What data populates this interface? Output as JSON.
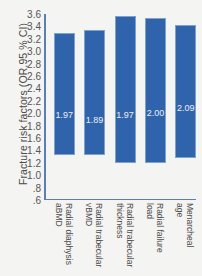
{
  "chart_data": {
    "type": "bar",
    "title": "",
    "subtitle": "",
    "xlabel": "",
    "ylabel": "Fracture risk factors (OR,95 % CI)",
    "ylim": [
      0.6,
      3.6
    ],
    "baseline": 1.0,
    "grid": false,
    "legend": null,
    "ytick_labels": [
      "3.6",
      "3.4",
      "3.2",
      "3.0",
      "2.8",
      "2.6",
      "2.4",
      "2.2",
      "2.0",
      "1.8",
      "1.6",
      "1.4",
      "1.2",
      "1.0",
      ".8",
      ".6"
    ],
    "ytick_values": [
      3.6,
      3.4,
      3.2,
      3.0,
      2.8,
      2.6,
      2.4,
      2.2,
      2.0,
      1.8,
      1.6,
      1.4,
      1.2,
      1.0,
      0.8,
      0.6
    ],
    "categories": [
      "Radial diaphysis\naBMD",
      "Radial trabecular\nvBMD",
      "Radial trabecular\nthickness",
      "Radial failure\nload",
      "Menarcheal\nage"
    ],
    "value_labels": [
      "1.97",
      "1.89",
      "1.97",
      "2.00",
      "2.09"
    ],
    "values": [
      1.97,
      1.89,
      1.97,
      2.0,
      2.09
    ],
    "ci_upper": [
      3.3,
      3.35,
      3.57,
      3.53,
      3.42
    ],
    "ci_lower": [
      1.32,
      1.33,
      1.2,
      1.19,
      1.27
    ],
    "bar_color": "#2f64ad",
    "axis_color": "#5b7fb4",
    "background_color": "#f4f4f2"
  }
}
